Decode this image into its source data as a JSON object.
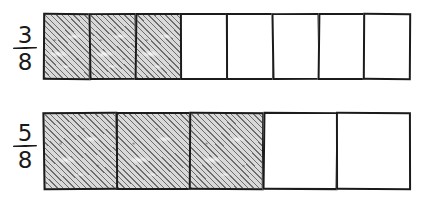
{
  "diagram": {
    "background_color": "#ffffff",
    "ink_color": "#1b1b1b",
    "shade_color": "#d9d9d9",
    "hatch_color": "#6e6e6e",
    "hatch_angle_degrees": 45,
    "style": "hand-drawn",
    "bars": [
      {
        "id": "top",
        "label": {
          "numerator": "3",
          "denominator": "8"
        },
        "total_cells": 8,
        "shaded_cells": 3,
        "unshaded_cells": 5,
        "cells": [
          "shaded",
          "shaded",
          "shaded",
          "unshaded",
          "unshaded",
          "unshaded",
          "unshaded",
          "unshaded"
        ]
      },
      {
        "id": "bottom",
        "label": {
          "numerator": "5",
          "denominator": "8"
        },
        "total_cells": 5,
        "shaded_cells": 3,
        "unshaded_cells": 2,
        "cells": [
          "shaded",
          "shaded",
          "shaded",
          "unshaded",
          "unshaded"
        ]
      }
    ]
  }
}
